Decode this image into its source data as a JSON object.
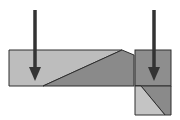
{
  "diagram": {
    "colors": {
      "background": "#ffffff",
      "light_fill": "#bdbdbd",
      "dark_fill": "#8a8a8a",
      "square_fill": "#8e8e8e",
      "lower_dark": "#8a8a8a",
      "lower_light": "#c4c4c4",
      "stroke": "#2e2e2e",
      "arrow": "#333333"
    },
    "arrows": [
      {
        "name": "left-arrow",
        "x": 35,
        "y1": 10,
        "y2": 80
      },
      {
        "name": "right-arrow",
        "x": 154,
        "y1": 10,
        "y2": 80
      }
    ]
  }
}
